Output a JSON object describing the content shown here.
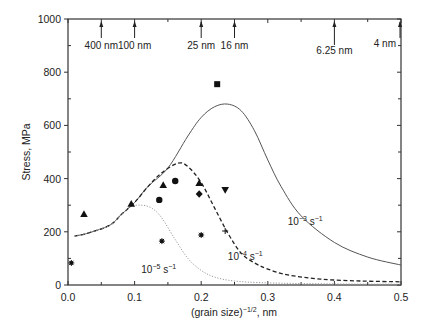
{
  "chart_data": {
    "type": "line",
    "title": "",
    "xlabel": "(grain size)^-1/2, nm",
    "ylabel": "Stress, MPa",
    "xlim": [
      0,
      0.5
    ],
    "ylim": [
      0,
      1000
    ],
    "grid": false,
    "x_ticks": [
      0.0,
      0.1,
      0.2,
      0.3,
      0.4,
      0.5
    ],
    "x_tick_labels": [
      "0.0",
      "0.1",
      "0.2",
      "0.3",
      "0.4",
      "0.5"
    ],
    "y_ticks": [
      0,
      200,
      400,
      600,
      800,
      1000
    ],
    "y_tick_labels": [
      "0",
      "200",
      "400",
      "600",
      "800",
      "1000"
    ],
    "top_axis_markers": [
      {
        "x": 0.05,
        "label": "400 nm"
      },
      {
        "x": 0.1,
        "label": "100 nm"
      },
      {
        "x": 0.2,
        "label": "25 nm"
      },
      {
        "x": 0.25,
        "label": "16 nm"
      },
      {
        "x": 0.4,
        "label": "6.25 nm"
      },
      {
        "x": 0.5,
        "label": "4 nm"
      }
    ],
    "series": [
      {
        "name": "10^-3 s^-1",
        "style": "solid",
        "color": "#555555",
        "x": [
          0.01,
          0.03,
          0.063,
          0.08,
          0.1,
          0.12,
          0.15,
          0.18,
          0.2,
          0.22,
          0.24,
          0.26,
          0.28,
          0.3,
          0.32,
          0.35,
          0.4,
          0.45,
          0.5
        ],
        "y": [
          184,
          195,
          225,
          265,
          310,
          370,
          440,
          560,
          630,
          670,
          680,
          655,
          580,
          470,
          370,
          260,
          160,
          105,
          75
        ]
      },
      {
        "name": "10^-4 s^-1",
        "style": "dashed",
        "color": "#222222",
        "x": [
          0.01,
          0.03,
          0.063,
          0.08,
          0.1,
          0.12,
          0.14,
          0.165,
          0.18,
          0.2,
          0.22,
          0.24,
          0.26,
          0.28,
          0.3,
          0.33,
          0.38,
          0.44,
          0.5
        ],
        "y": [
          184,
          195,
          225,
          265,
          310,
          370,
          420,
          458,
          445,
          385,
          290,
          195,
          120,
          83,
          60,
          38,
          22,
          15,
          12
        ]
      },
      {
        "name": "10^-5 s^-1",
        "style": "dotted",
        "color": "#999999",
        "x": [
          0.01,
          0.03,
          0.063,
          0.08,
          0.095,
          0.11,
          0.125,
          0.14,
          0.16,
          0.18,
          0.2,
          0.22,
          0.25,
          0.3,
          0.4,
          0.5
        ],
        "y": [
          184,
          195,
          225,
          265,
          295,
          300,
          290,
          255,
          175,
          100,
          55,
          30,
          15,
          8,
          4,
          3
        ]
      }
    ],
    "curve_labels": [
      {
        "text": "10",
        "exp": "−3",
        "unit": " s",
        "unit_exp": "−1",
        "x": 0.33,
        "y": 225
      },
      {
        "text": "10",
        "exp": "−4",
        "unit": " s",
        "unit_exp": "−1",
        "x": 0.24,
        "y": 95
      },
      {
        "text": "10",
        "exp": "−5",
        "unit": " s",
        "unit_exp": "−1",
        "x": 0.11,
        "y": 45
      }
    ],
    "scatter_points": [
      {
        "marker": "square",
        "x": 0.224,
        "y": 755
      },
      {
        "marker": "triangle-up",
        "x": 0.024,
        "y": 267
      },
      {
        "marker": "triangle-up",
        "x": 0.095,
        "y": 305
      },
      {
        "marker": "triangle-up",
        "x": 0.143,
        "y": 376
      },
      {
        "marker": "triangle-up",
        "x": 0.197,
        "y": 383
      },
      {
        "marker": "circle",
        "x": 0.137,
        "y": 320
      },
      {
        "marker": "circle",
        "x": 0.161,
        "y": 391
      },
      {
        "marker": "diamond",
        "x": 0.197,
        "y": 342
      },
      {
        "marker": "triangle-down",
        "x": 0.236,
        "y": 357
      },
      {
        "marker": "asterisk",
        "x": 0.005,
        "y": 83
      },
      {
        "marker": "asterisk",
        "x": 0.141,
        "y": 165
      },
      {
        "marker": "asterisk",
        "x": 0.2,
        "y": 188
      },
      {
        "marker": "plus",
        "x": 0.236,
        "y": 203
      }
    ]
  },
  "layout": {
    "plot_left": 68,
    "plot_right": 401,
    "plot_top": 19,
    "plot_bottom": 285
  }
}
